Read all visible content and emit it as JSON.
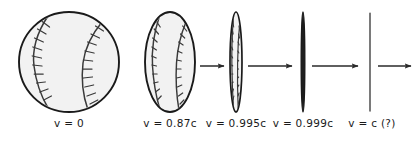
{
  "figure": {
    "background_color": "#ffffff",
    "ink_color": "#1a1a1a",
    "ball_fill_color": "#f2f2f2",
    "seam_color": "#3a3a3a"
  },
  "stages": [
    {
      "id": "stage-1",
      "shape": "circle",
      "label": "v = 0",
      "velocity_text": "0",
      "symbol": "ʋ",
      "center_x": 69,
      "center_y": 62,
      "rx": 50,
      "ry": 50,
      "label_x": 69,
      "seams": true
    },
    {
      "id": "stage-2",
      "shape": "ellipse",
      "label": "v = 0.87c",
      "velocity_text": "0.87c",
      "symbol": "ʋ",
      "center_x": 170,
      "center_y": 62,
      "rx": 25,
      "ry": 50,
      "label_x": 170,
      "seams": true
    },
    {
      "id": "stage-3",
      "shape": "ellipse",
      "label": "v = 0.995c",
      "velocity_text": "0.995c",
      "symbol": "ʋ",
      "center_x": 236,
      "center_y": 62,
      "rx": 6,
      "ry": 50,
      "label_x": 236,
      "seams": true
    },
    {
      "id": "stage-4",
      "shape": "thick-line",
      "label": "v = 0.999c",
      "velocity_text": "0.999c",
      "symbol": "ʋ",
      "center_x": 303,
      "center_y": 62,
      "rx": 1.8,
      "ry": 50,
      "label_x": 303,
      "seams": false
    },
    {
      "id": "stage-5",
      "shape": "thin-line",
      "label": "v = c (?)",
      "velocity_text": "c (?)",
      "symbol": "ʋ",
      "center_x": 370,
      "center_y": 62,
      "rx": 0.6,
      "ry": 50,
      "label_x": 372,
      "seams": false
    }
  ],
  "arrows": [
    {
      "id": "arrow-1",
      "from_stage": "stage-2",
      "to_stage": "stage-3",
      "x1": 200,
      "x2": 224,
      "y": 66
    },
    {
      "id": "arrow-2",
      "from_stage": "stage-3",
      "to_stage": "stage-4",
      "x1": 248,
      "x2": 292,
      "y": 66
    },
    {
      "id": "arrow-3",
      "from_stage": "stage-4",
      "to_stage": "stage-5",
      "x1": 312,
      "x2": 358,
      "y": 66
    },
    {
      "id": "arrow-4",
      "from_stage": "stage-5",
      "to_stage": "end",
      "x1": 378,
      "x2": 412,
      "y": 66
    }
  ],
  "equals_sign": "="
}
